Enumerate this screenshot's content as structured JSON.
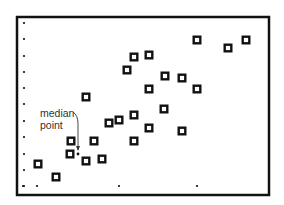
{
  "chart_data": {
    "type": "scatter",
    "title": "",
    "xlabel": "",
    "ylabel": "",
    "grid": false,
    "legend": null,
    "frame": {
      "left": 17,
      "top": 17,
      "right": 269,
      "bottom": 195
    },
    "axis_tick_dots": {
      "left": {
        "x": 24,
        "y": [
          23,
          39,
          56,
          72,
          88,
          104,
          121,
          137,
          154,
          170,
          186
        ]
      },
      "bottom": {
        "y": 186,
        "x": [
          23,
          37,
          119,
          197
        ]
      }
    },
    "points_pixel": [
      [
        38,
        164
      ],
      [
        56,
        177
      ],
      [
        70,
        154
      ],
      [
        71,
        141
      ],
      [
        86,
        97
      ],
      [
        86,
        161
      ],
      [
        94,
        141
      ],
      [
        102,
        159
      ],
      [
        109,
        123
      ],
      [
        119,
        120
      ],
      [
        134,
        115
      ],
      [
        134,
        141
      ],
      [
        127,
        70
      ],
      [
        134,
        57
      ],
      [
        149,
        55
      ],
      [
        149,
        89
      ],
      [
        149,
        128
      ],
      [
        164,
        109
      ],
      [
        165,
        76
      ],
      [
        182,
        78
      ],
      [
        182,
        131
      ],
      [
        197,
        40
      ],
      [
        197,
        89
      ],
      [
        228,
        48
      ],
      [
        246,
        40
      ]
    ],
    "median_point": [
      78,
      154
    ],
    "annotations": [
      {
        "text_lines": [
          "median",
          "point"
        ],
        "x": 40,
        "y": 115,
        "points_to": "median_point"
      }
    ],
    "colors": {
      "marker": "#111111",
      "background": "#ffffff",
      "frame": "#111111",
      "annotation": "#333333"
    }
  }
}
